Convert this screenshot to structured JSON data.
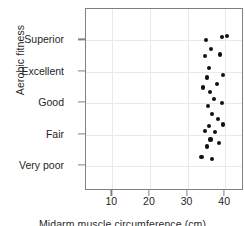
{
  "chart_data": {
    "type": "scatter",
    "title": "",
    "xlabel": "Midarm muscle circumference (cm)",
    "ylabel": "Aerobic fitness",
    "xlim": [
      3,
      45
    ],
    "ylim": [
      0.2,
      6.0
    ],
    "grid": true,
    "legend": null,
    "xticks": [
      10,
      20,
      30,
      40
    ],
    "xtick_labels": [
      "10",
      "20",
      "30",
      "40"
    ],
    "yticks": [
      1,
      2,
      3,
      4,
      5
    ],
    "ytick_labels": [
      "Very poor",
      "Fair",
      "Good",
      "Excellent",
      "Superior"
    ],
    "marker": "filled-circle",
    "marker_color": "#111111",
    "points": [
      {
        "x": 39.2,
        "y": 5.12
      },
      {
        "x": 40.4,
        "y": 5.15
      },
      {
        "x": 35.0,
        "y": 5.0
      },
      {
        "x": 36.3,
        "y": 4.72
      },
      {
        "x": 38.7,
        "y": 4.55
      },
      {
        "x": 34.6,
        "y": 4.5
      },
      {
        "x": 35.6,
        "y": 4.12
      },
      {
        "x": 39.4,
        "y": 3.9
      },
      {
        "x": 35.2,
        "y": 3.82
      },
      {
        "x": 37.8,
        "y": 3.62
      },
      {
        "x": 34.2,
        "y": 3.5
      },
      {
        "x": 36.0,
        "y": 3.35
      },
      {
        "x": 37.1,
        "y": 3.12
      },
      {
        "x": 39.2,
        "y": 3.0
      },
      {
        "x": 35.4,
        "y": 2.9
      },
      {
        "x": 36.6,
        "y": 2.66
      },
      {
        "x": 38.1,
        "y": 2.5
      },
      {
        "x": 39.4,
        "y": 2.32
      },
      {
        "x": 35.8,
        "y": 2.28
      },
      {
        "x": 34.6,
        "y": 2.12
      },
      {
        "x": 37.3,
        "y": 2.08
      },
      {
        "x": 36.1,
        "y": 1.84
      },
      {
        "x": 38.3,
        "y": 1.72
      },
      {
        "x": 35.1,
        "y": 1.62
      },
      {
        "x": 33.7,
        "y": 1.28
      },
      {
        "x": 36.4,
        "y": 1.22
      }
    ],
    "axis_color": "#808080",
    "grid_color": "#e9e9e9"
  }
}
